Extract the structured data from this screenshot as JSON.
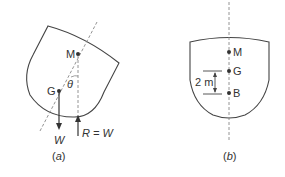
{
  "figures": [
    {
      "id": "a",
      "caption": "(a)",
      "caption_letter": "a",
      "points": [
        {
          "name": "M",
          "label": "M"
        },
        {
          "name": "G",
          "label": "G"
        }
      ],
      "angle_label": "θ",
      "weight_label": "W",
      "reaction_label": "R = W"
    },
    {
      "id": "b",
      "caption": "(b)",
      "caption_letter": "b",
      "points": [
        {
          "name": "M",
          "label": "M"
        },
        {
          "name": "G",
          "label": "G"
        },
        {
          "name": "B",
          "label": "B"
        }
      ],
      "dimension_label": "2 m"
    }
  ],
  "colors": {
    "line": "#444444",
    "dashed": "#888888",
    "point": "#333333"
  }
}
